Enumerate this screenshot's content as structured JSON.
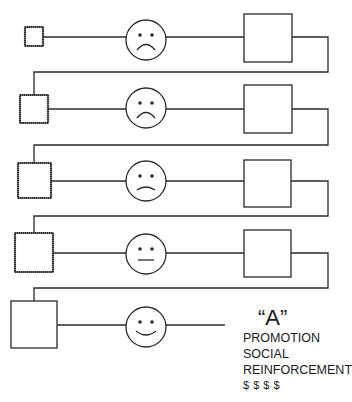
{
  "diagram": {
    "title": "",
    "stroke_color": "#2a2a2a",
    "rows": [
      {
        "index": 1,
        "input_square": {
          "x": 25,
          "y": 27,
          "w": 18,
          "h": 19,
          "dotted": true
        },
        "line_y": 37,
        "face": {
          "cx": 146,
          "cy": 40,
          "r": 20,
          "expression": "sad"
        },
        "output_box": {
          "x": 244,
          "y": 14,
          "w": 48,
          "h": 48
        }
      },
      {
        "index": 2,
        "input_square": {
          "x": 20,
          "y": 95,
          "w": 28,
          "h": 28,
          "dotted": true
        },
        "line_y": 109,
        "face": {
          "cx": 146,
          "cy": 108,
          "r": 20,
          "expression": "sad"
        },
        "output_box": {
          "x": 244,
          "y": 85,
          "w": 48,
          "h": 48
        }
      },
      {
        "index": 3,
        "input_square": {
          "x": 18,
          "y": 163,
          "w": 33,
          "h": 35,
          "dotted": true
        },
        "line_y": 181,
        "face": {
          "cx": 146,
          "cy": 181,
          "r": 20,
          "expression": "slightly-sad"
        },
        "output_box": {
          "x": 244,
          "y": 160,
          "w": 47,
          "h": 47
        }
      },
      {
        "index": 4,
        "input_square": {
          "x": 15,
          "y": 233,
          "w": 38,
          "h": 39,
          "dotted": true
        },
        "line_y": 253,
        "face": {
          "cx": 146,
          "cy": 254,
          "r": 20,
          "expression": "neutral"
        },
        "output_box": {
          "x": 244,
          "y": 230,
          "w": 47,
          "h": 47
        }
      },
      {
        "index": 5,
        "input_square": {
          "x": 11,
          "y": 301,
          "w": 46,
          "h": 47,
          "dotted": false
        },
        "line_y": 325,
        "face": {
          "cx": 146,
          "cy": 327,
          "r": 20,
          "expression": "happy"
        },
        "output_box": null
      }
    ],
    "connectors": [
      {
        "from_row": 1,
        "right_x": 328,
        "return_y": 72,
        "left_x": 34
      },
      {
        "from_row": 2,
        "right_x": 328,
        "return_y": 145,
        "left_x": 34
      },
      {
        "from_row": 3,
        "right_x": 328,
        "return_y": 216,
        "left_x": 34
      },
      {
        "from_row": 4,
        "right_x": 328,
        "return_y": 288,
        "left_x": 34
      }
    ],
    "final_line_end_x": 225
  },
  "outcome": {
    "grade": "“A”",
    "lines": [
      "PROMOTION",
      "SOCIAL",
      "REINFORCEMENT"
    ],
    "money": "$ $ $ $"
  }
}
